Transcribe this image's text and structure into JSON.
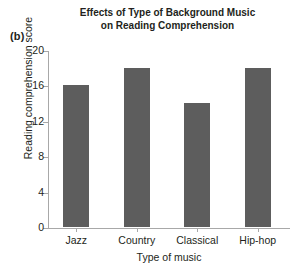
{
  "panel": {
    "label": "(b)"
  },
  "chart_data": {
    "type": "bar",
    "title": "Effects of Type of Background Music on Reading Comprehension",
    "title_lines": [
      "Effects of Type of Background Music",
      "on Reading Comprehension"
    ],
    "categories": [
      "Jazz",
      "Country",
      "Classical",
      "Hip-hop"
    ],
    "values": [
      16,
      18,
      14,
      18
    ],
    "xlabel": "Type of music",
    "ylabel": "Reading comprehension score",
    "ylim": [
      0,
      20
    ],
    "yticks": [
      0,
      4,
      8,
      12,
      16,
      20
    ],
    "ytick_labels": [
      "0",
      "4",
      "8",
      "12",
      "16",
      "20"
    ],
    "grid": false,
    "legend": false,
    "bar_color": "#5d5d5d",
    "axis_color": "#a8a8a8",
    "text_color": "#231f20",
    "background": "#ffffff"
  }
}
